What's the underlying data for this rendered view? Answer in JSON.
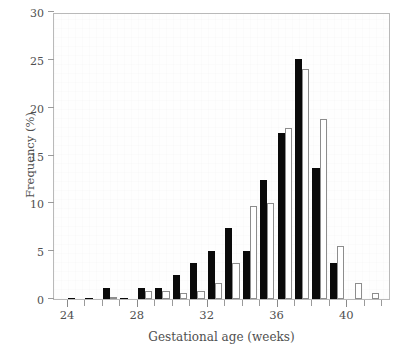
{
  "chart_data": {
    "type": "bar",
    "title": "",
    "xlabel": "Gestational age (weeks)",
    "ylabel": "Frequency (%)",
    "xlim": [
      23.2,
      42.5
    ],
    "ylim": [
      0,
      30
    ],
    "xticks": [
      24,
      25,
      26,
      27,
      28,
      29,
      30,
      31,
      32,
      33,
      34,
      35,
      36,
      37,
      38,
      39,
      40,
      41,
      42
    ],
    "xtick_labels": [
      "24",
      "28",
      "32",
      "36",
      "40"
    ],
    "xtick_label_values": [
      24,
      28,
      32,
      36,
      40
    ],
    "yticks": [
      0,
      5,
      10,
      15,
      20,
      25,
      30
    ],
    "ytick_labels": [
      "0",
      "5",
      "10",
      "15",
      "20",
      "25",
      "30"
    ],
    "grid": false,
    "legend_position": "none",
    "categories": [
      24,
      25,
      26,
      27,
      28,
      29,
      30,
      31,
      32,
      33,
      34,
      35,
      36,
      37,
      38,
      39,
      40,
      41
    ],
    "series": [
      {
        "name": "black",
        "style": "filled-black",
        "color": "#0a0a0a",
        "values": [
          0.1,
          0.1,
          1.2,
          0.1,
          1.2,
          1.2,
          2.5,
          3.8,
          5.0,
          7.4,
          5.0,
          12.4,
          17.4,
          25.1,
          13.7,
          3.8,
          0.0,
          0.0
        ]
      },
      {
        "name": "white",
        "style": "open-outline",
        "color": "#ffffff",
        "edge_color": "#8d8d8d",
        "values": [
          0.0,
          0.0,
          0.1,
          0.0,
          0.8,
          0.8,
          0.6,
          0.8,
          1.7,
          3.8,
          9.7,
          10.0,
          17.9,
          24.0,
          18.8,
          5.5,
          1.7,
          0.6
        ]
      }
    ]
  }
}
